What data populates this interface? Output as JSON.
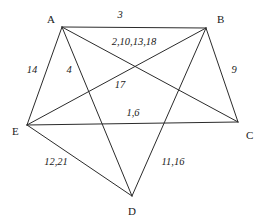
{
  "figure": {
    "kind": "undirected-weighted-graph-diagram",
    "width": 262,
    "height": 219,
    "background_color": "#ffffff",
    "line_color": "#2b2b2b",
    "text_color": "#1a1a1a"
  },
  "chart_data": {
    "type": "diagram",
    "subtype": "graph",
    "title": "",
    "xlabel": "",
    "ylabel": "",
    "grid": false,
    "legend": false,
    "nodes": [
      {
        "id": "A",
        "label": "A",
        "x": 62,
        "y": 27,
        "label_x": 47,
        "label_y": 14
      },
      {
        "id": "B",
        "label": "B",
        "x": 206,
        "y": 28,
        "label_x": 217,
        "label_y": 14
      },
      {
        "id": "C",
        "label": "C",
        "x": 238,
        "y": 122,
        "label_x": 246,
        "label_y": 130
      },
      {
        "id": "D",
        "label": "D",
        "x": 132,
        "y": 196,
        "label_x": 128,
        "label_y": 206
      },
      {
        "id": "E",
        "label": "E",
        "x": 27,
        "y": 125,
        "label_x": 12,
        "label_y": 126
      }
    ],
    "edges": [
      {
        "from": "A",
        "to": "B",
        "label": "3",
        "label_x": 120,
        "label_y": 15
      },
      {
        "from": "A",
        "to": "C",
        "label": "2,10,13,18",
        "label_x": 134,
        "label_y": 42
      },
      {
        "from": "A",
        "to": "E",
        "label": "14",
        "label_x": 32,
        "label_y": 70
      },
      {
        "from": "A",
        "to": "D",
        "label": "4",
        "label_x": 69,
        "label_y": 70
      },
      {
        "from": "B",
        "to": "C",
        "label": "9",
        "label_x": 234,
        "label_y": 70
      },
      {
        "from": "B",
        "to": "E",
        "label": "17",
        "label_x": 120,
        "label_y": 85
      },
      {
        "from": "B",
        "to": "D",
        "label": "11,16",
        "label_x": 173,
        "label_y": 162
      },
      {
        "from": "E",
        "to": "C",
        "label": "1,6",
        "label_x": 133,
        "label_y": 113
      },
      {
        "from": "E",
        "to": "D",
        "label": "12,21",
        "label_x": 56,
        "label_y": 162
      }
    ]
  }
}
